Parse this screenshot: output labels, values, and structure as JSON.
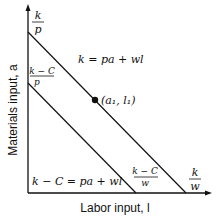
{
  "diagram": {
    "y_axis_label": "Materials input, a",
    "x_axis_label": "Labor input, l",
    "y_tick_outer": {
      "num": "k",
      "den": "p"
    },
    "y_tick_inner": {
      "num": "k − C",
      "den": "p"
    },
    "x_tick_inner": {
      "num": "k − C",
      "den": "w"
    },
    "x_tick_outer": {
      "num": "k",
      "den": "w"
    },
    "outer_line_label": "k = pa + wl",
    "inner_line_label": "k − C = pa + wl",
    "point_label": "(a₁, l₁)",
    "colors": {
      "line": "#111111",
      "background": "#ffffff"
    }
  }
}
